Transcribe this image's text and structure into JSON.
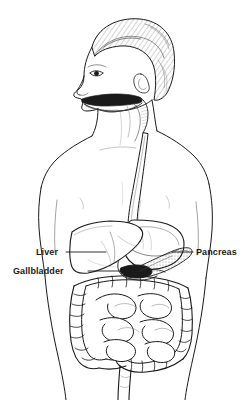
{
  "figure": {
    "style": "black-and-white line art",
    "width": 249,
    "height": 400,
    "background_color": "#ffffff",
    "ink_color": "#1a1a1a"
  },
  "labels": [
    {
      "id": "liver",
      "text": "Liver",
      "side": "left",
      "leader_from_x": 66,
      "leader_to_x": 106,
      "leader_y": 252
    },
    {
      "id": "gallbladder",
      "text": "Gallbladder",
      "side": "left",
      "leader_from_x": 88,
      "leader_to_x": 121,
      "leader_y": 271
    },
    {
      "id": "pancreas",
      "text": "Pancreas",
      "side": "right",
      "leader_from_x": 172,
      "leader_to_x": 193,
      "leader_y": 252
    }
  ],
  "anatomy_parts": [
    "head-profile",
    "hair",
    "ear",
    "eye",
    "nose",
    "open-mouth",
    "tongue",
    "pharynx",
    "neck",
    "shoulders",
    "left-arm",
    "right-arm",
    "torso",
    "esophagus",
    "stomach",
    "liver",
    "gallbladder",
    "pancreas",
    "small-intestine",
    "large-intestine",
    "sigmoid-colon",
    "rectum"
  ]
}
